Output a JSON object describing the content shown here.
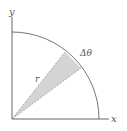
{
  "diagram": {
    "type": "polar-area-element",
    "labels": {
      "y_axis": "y",
      "x_axis": "x",
      "radius": "r",
      "angle": "Δθ"
    },
    "colors": {
      "axis": "#555555",
      "arc": "#666666",
      "wedge_fill": "#d4d4d4",
      "wedge_edge": "#9a9a9a",
      "text": "#555555"
    }
  }
}
